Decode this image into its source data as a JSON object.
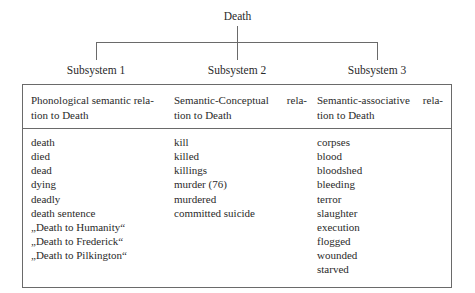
{
  "root": {
    "label": "Death"
  },
  "subsystems": [
    {
      "label": "Subsystem 1"
    },
    {
      "label": "Subsystem 2"
    },
    {
      "label": "Subsystem 3"
    }
  ],
  "columns": [
    {
      "header_line1_left": "Phonological semantic rela-",
      "header_line1_right": "",
      "header_line2": "tion to Death",
      "items": [
        "death",
        "died",
        "dead",
        "dying",
        "deadly",
        "death sentence",
        "„Death to Humanity“",
        "„Death to Frederick“",
        "„Death to Pilkington“"
      ]
    },
    {
      "header_line1_left": "Semantic-Conceptual",
      "header_line1_right": "rela-",
      "header_line2": "tion to Death",
      "items": [
        "kill",
        "killed",
        "killings",
        "murder (76)",
        "murdered",
        "committed suicide"
      ]
    },
    {
      "header_line1_left": "Semantic-associative",
      "header_line1_right": "rela-",
      "header_line2": "tion to Death",
      "items": [
        "corpses",
        "blood",
        "bloodshed",
        "bleeding",
        "terror",
        "slaughter",
        "execution",
        "flogged",
        "wounded",
        "starved"
      ]
    }
  ]
}
